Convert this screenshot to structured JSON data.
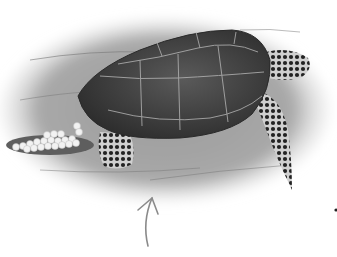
{
  "image": {
    "subject": "Sea turtle laying eggs in a sand nest",
    "style": "grayscale illustration",
    "elements": [
      "sand-background",
      "turtle-shell",
      "turtle-head",
      "front-flipper",
      "rear-flipper",
      "egg-clutch",
      "pointer-arrow",
      "dot"
    ]
  },
  "colors": {
    "background": "#ffffff",
    "sand": "#9a9a9a",
    "sand_dark": "#6e6e6e",
    "shell": "#3e3e3e",
    "shell_lines": "#b5b5b5",
    "skin": "#2a2a2a",
    "eggs": "#f2f2f2",
    "arrow": "#8a8a8a"
  }
}
